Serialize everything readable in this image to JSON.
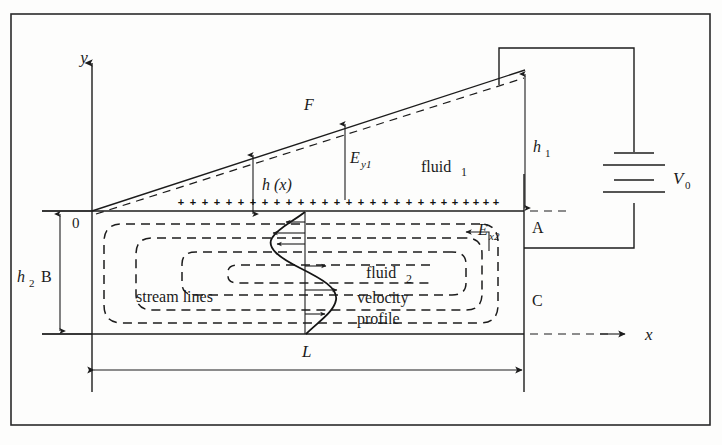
{
  "figure": {
    "labels": {
      "y_axis": "y",
      "x_axis": "x",
      "origin": "0",
      "point_A": "A",
      "point_B": "B",
      "point_C": "C",
      "interface_F": "F",
      "film_thickness": "h (x)",
      "height_h1": "h",
      "height_h1_sub": "1",
      "height_h2": "h",
      "height_h2_sub": "2",
      "length_L": "L",
      "voltage": "V",
      "voltage_sub": "0",
      "field_y1": "E",
      "field_y1_sub": "y1",
      "field_x2": "E",
      "field_x2_sub": "x2",
      "fluid_1": "fluid",
      "fluid_1_num": "1",
      "fluid_2": "fluid",
      "fluid_2_num": "2",
      "streamlines": "stream lines",
      "velocity": "velocity",
      "profile": "profile"
    },
    "charge_row": {
      "symbol": "+",
      "count": 28,
      "x_start": 181,
      "x_end": 503,
      "y": 206
    },
    "colors": {
      "ink": "#1c1c1c",
      "background": "#fdfdfc",
      "frame": "#2a2a2a"
    },
    "geometry": {
      "frame": {
        "x": 11,
        "y": 14,
        "width": 699,
        "height": 411
      },
      "left_wall_x": 92,
      "right_wall_x": 524,
      "interface_y": 211,
      "bottom_wall_y": 334,
      "slant_peak_y": 70,
      "channel_length_L_px": 432
    }
  }
}
